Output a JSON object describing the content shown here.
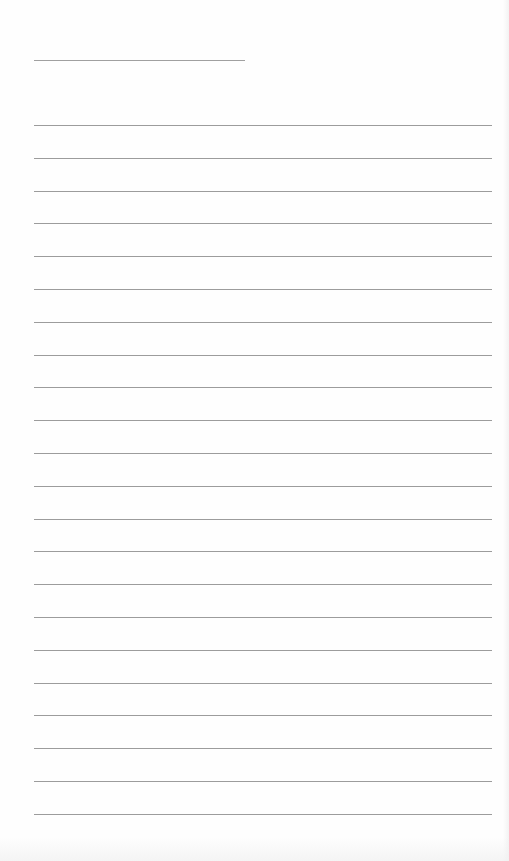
{
  "page": {
    "type": "lined-paper",
    "line_color": "#9c9c9c",
    "background_color": "#fefefe"
  },
  "title_line": {
    "left": 34,
    "top": 60,
    "width": 211
  },
  "ruled_lines": {
    "count": 22,
    "left": 34,
    "first_top": 125,
    "spacing": 32.8,
    "width": 458
  }
}
